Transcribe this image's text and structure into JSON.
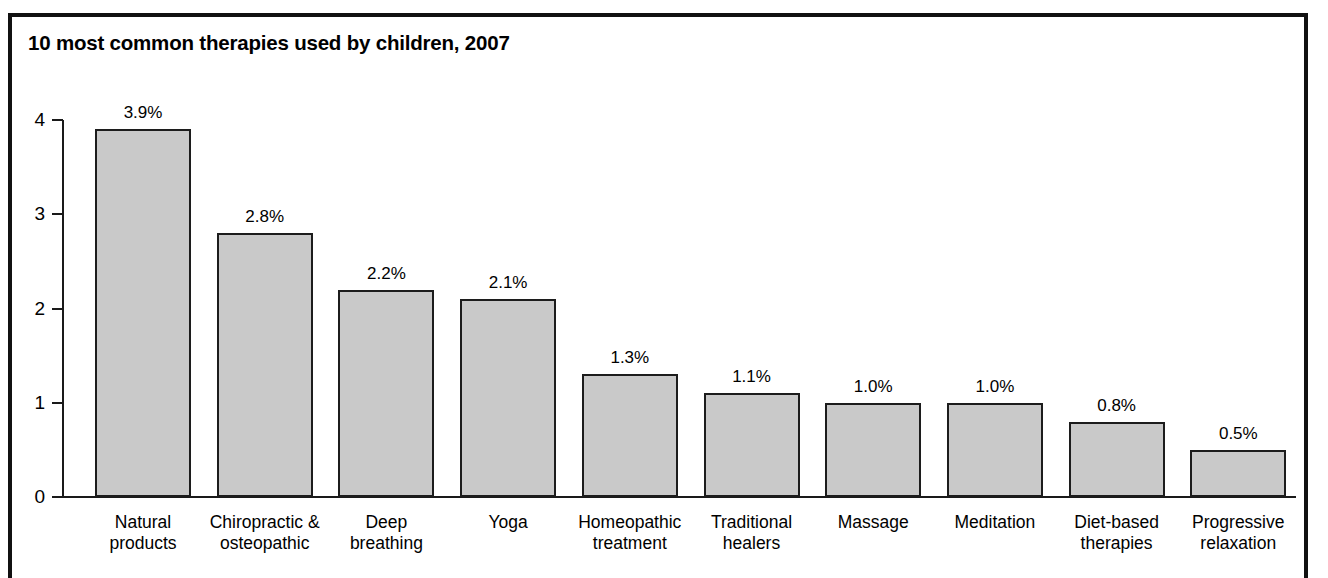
{
  "chart_data": {
    "type": "bar",
    "title": "10 most common therapies used by children, 2007",
    "xlabel": "",
    "ylabel": "",
    "ylim": [
      0,
      4
    ],
    "yticks": [
      "0",
      "1",
      "2",
      "3",
      "4"
    ],
    "grid": false,
    "legend": "none",
    "value_suffix": "%",
    "categories": [
      "Natural products",
      "Chiropractic & osteopathic",
      "Deep breathing",
      "Yoga",
      "Homeopathic treatment",
      "Traditional healers",
      "Massage",
      "Meditation",
      "Diet-based therapies",
      "Progressive relaxation"
    ],
    "category_lines": [
      [
        "Natural",
        "products"
      ],
      [
        "Chiropractic &",
        "osteopathic"
      ],
      [
        "Deep",
        "breathing"
      ],
      [
        "Yoga",
        ""
      ],
      [
        "Homeopathic",
        "treatment"
      ],
      [
        "Traditional",
        "healers"
      ],
      [
        "Massage",
        ""
      ],
      [
        "Meditation",
        ""
      ],
      [
        "Diet-based",
        "therapies"
      ],
      [
        "Progressive",
        "relaxation"
      ]
    ],
    "values": [
      3.9,
      2.8,
      2.2,
      2.1,
      1.3,
      1.1,
      1.0,
      1.0,
      0.8,
      0.5
    ],
    "value_labels": [
      "3.9%",
      "2.8%",
      "2.2%",
      "2.1%",
      "1.3%",
      "1.1%",
      "1.0%",
      "1.0%",
      "0.8%",
      "0.5%"
    ],
    "bar_fill_color": "#c9c9c9",
    "bar_edge_color": "#1c1c1c",
    "axis_color": "#1a1a1a",
    "background_color": "#ffffff"
  }
}
